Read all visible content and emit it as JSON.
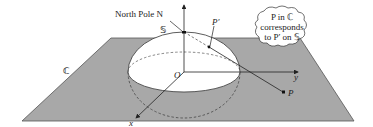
{
  "diagram": {
    "labels": {
      "north_pole": "North Pole N",
      "sphere": "𝕊",
      "plane": "ℂ",
      "origin": "O",
      "x_axis": "x",
      "y_axis": "y",
      "point_plane": "P",
      "point_sphere": "P′"
    },
    "callout": {
      "line1": "P in ℂ",
      "line2": "corresponds",
      "line3": "to P′ on 𝕊"
    },
    "colors": {
      "plane_fill": "#a8a8a8",
      "sphere_fill": "#ffffff",
      "stroke": "#333333"
    }
  }
}
